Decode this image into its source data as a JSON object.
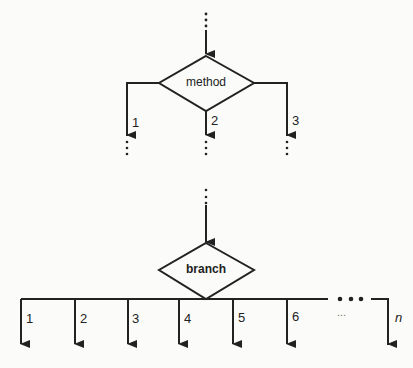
{
  "diagram": {
    "type": "flowchart",
    "top": {
      "decision_label": "method",
      "branches": [
        "1",
        "2",
        "3"
      ]
    },
    "bottom": {
      "decision_label": "branch",
      "branches": [
        "1",
        "2",
        "3",
        "4",
        "5",
        "6",
        "n"
      ],
      "ellipsis": "..."
    }
  },
  "colors": {
    "line": "#222222",
    "background": "#fbfbf9"
  }
}
